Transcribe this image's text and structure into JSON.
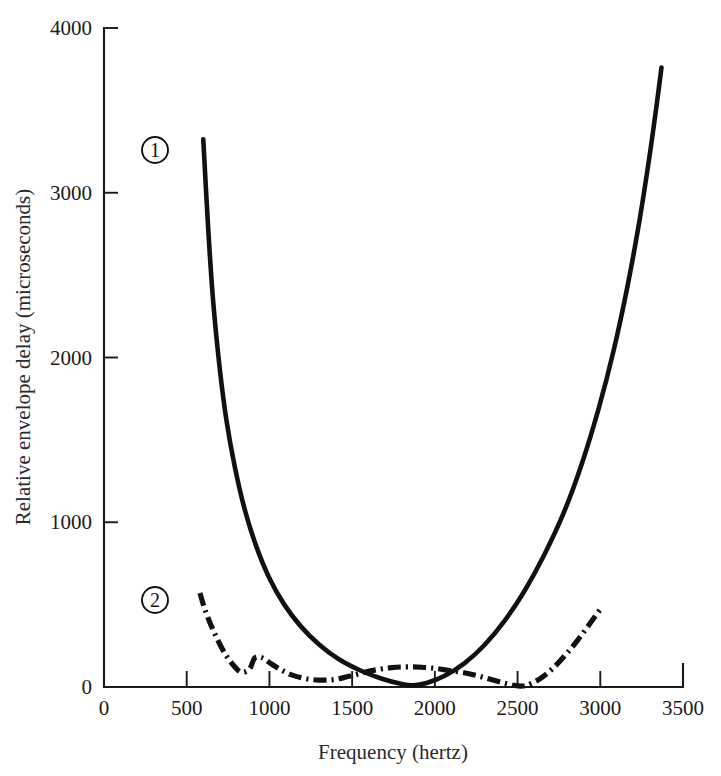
{
  "chart_data": {
    "type": "line",
    "title": "",
    "xlabel": "Frequency (hertz)",
    "ylabel": "Relative envelope delay (microseconds)",
    "xlim": [
      0,
      3500
    ],
    "ylim": [
      0,
      4000
    ],
    "xticks": [
      0,
      500,
      1000,
      1500,
      2000,
      2500,
      3000,
      3500
    ],
    "xticklabels": [
      "0",
      "500",
      "1000",
      "1500",
      "2000",
      "2500",
      "3000",
      "3500"
    ],
    "yticks": [
      0,
      1000,
      2000,
      3000,
      4000
    ],
    "yticklabels": [
      "0",
      "1000",
      "2000",
      "3000",
      "4000"
    ],
    "grid": false,
    "legend": "inline-circled-numbers",
    "series": [
      {
        "name": "1",
        "label": "1",
        "marker_label": "①",
        "style": "solid",
        "color": "#111111",
        "points": [
          [
            600,
            3325
          ],
          [
            630,
            2780
          ],
          [
            660,
            2340
          ],
          [
            700,
            1930
          ],
          [
            740,
            1620
          ],
          [
            790,
            1340
          ],
          [
            850,
            1080
          ],
          [
            920,
            855
          ],
          [
            1000,
            660
          ],
          [
            1090,
            500
          ],
          [
            1190,
            368
          ],
          [
            1300,
            258
          ],
          [
            1420,
            168
          ],
          [
            1550,
            100
          ],
          [
            1680,
            50
          ],
          [
            1800,
            18
          ],
          [
            1870,
            10
          ],
          [
            1950,
            24
          ],
          [
            2060,
            68
          ],
          [
            2180,
            145
          ],
          [
            2300,
            255
          ],
          [
            2420,
            400
          ],
          [
            2540,
            580
          ],
          [
            2660,
            800
          ],
          [
            2780,
            1060
          ],
          [
            2890,
            1360
          ],
          [
            2990,
            1690
          ],
          [
            3080,
            2040
          ],
          [
            3160,
            2410
          ],
          [
            3230,
            2790
          ],
          [
            3290,
            3170
          ],
          [
            3335,
            3490
          ],
          [
            3370,
            3760
          ]
        ]
      },
      {
        "name": "2",
        "label": "2",
        "marker_label": "②",
        "style": "dash-dot",
        "color": "#111111",
        "points": [
          [
            580,
            570
          ],
          [
            610,
            470
          ],
          [
            645,
            380
          ],
          [
            685,
            290
          ],
          [
            730,
            205
          ],
          [
            780,
            135
          ],
          [
            830,
            90
          ],
          [
            880,
            110
          ],
          [
            910,
            175
          ],
          [
            950,
            180
          ],
          [
            1000,
            148
          ],
          [
            1060,
            110
          ],
          [
            1130,
            75
          ],
          [
            1210,
            52
          ],
          [
            1300,
            42
          ],
          [
            1390,
            45
          ],
          [
            1470,
            62
          ],
          [
            1560,
            85
          ],
          [
            1650,
            105
          ],
          [
            1740,
            118
          ],
          [
            1830,
            122
          ],
          [
            1920,
            120
          ],
          [
            2010,
            112
          ],
          [
            2090,
            100
          ],
          [
            2170,
            88
          ],
          [
            2250,
            70
          ],
          [
            2330,
            48
          ],
          [
            2410,
            26
          ],
          [
            2480,
            10
          ],
          [
            2530,
            6
          ],
          [
            2580,
            20
          ],
          [
            2650,
            60
          ],
          [
            2720,
            120
          ],
          [
            2790,
            195
          ],
          [
            2860,
            280
          ],
          [
            2930,
            375
          ],
          [
            3000,
            470
          ],
          [
            3020,
            480
          ]
        ]
      }
    ],
    "annotations": [
      {
        "text": "①",
        "series": "1",
        "x_px": 155,
        "y_px": 150
      },
      {
        "text": "②",
        "series": "2",
        "x_px": 155,
        "y_px": 600
      }
    ]
  }
}
